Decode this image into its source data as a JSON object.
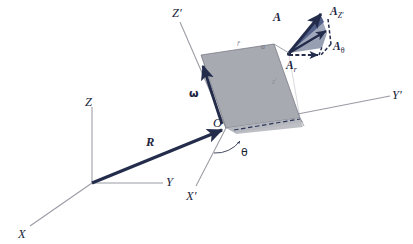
{
  "figure": {
    "type": "vector-diagram",
    "background": "#ffffff"
  },
  "colors": {
    "vector_navy": "#2b3557",
    "vector_navy_dark": "#232c4b",
    "plane_fill": "#a8aab1",
    "plane_fill_light": "#b9bbc2",
    "triangle_fill": "#6b7795",
    "triangle_fill_light": "#9aa2b6",
    "axis_gray": "#9a9ba4",
    "label_ink": "#1a1f33",
    "faint_ink": "#8d8f9c"
  },
  "fixed_frame": {
    "name": "fixed-frame-XYZ",
    "origin_label": "",
    "axes": [
      {
        "id": "axis-Z",
        "label": "Z",
        "description": "vertical axis of fixed frame"
      },
      {
        "id": "axis-Y",
        "label": "Y",
        "description": "horizontal axis of fixed frame"
      },
      {
        "id": "axis-X",
        "label": "X",
        "description": "axis receding to lower left"
      }
    ]
  },
  "rotating_frame": {
    "name": "rotating-frame-XYZ-prime",
    "origin_label": "O",
    "axes": [
      {
        "id": "axis-Z-prime",
        "label": "Z",
        "prime": "′",
        "description": "vertical axis of rotating frame"
      },
      {
        "id": "axis-Y-prime",
        "label": "Y",
        "prime": "′",
        "description": "axis to the right of rotating frame"
      },
      {
        "id": "axis-X-prime",
        "label": "X",
        "prime": "′",
        "description": "axis toward viewer lower left"
      }
    ],
    "angle": {
      "id": "angle-theta",
      "label": "θ",
      "description": "rotation angle between X′ and the rotating plane"
    },
    "angular_velocity": {
      "id": "vector-omega",
      "label": "ω",
      "description": "angular velocity vector along Z′ edge of plane"
    },
    "plane_labels": [
      {
        "id": "label-r-bar",
        "text": "r̄",
        "description": "faint radial label on plane top edge"
      },
      {
        "id": "label-a-point",
        "text": "a",
        "description": "point a at corner of plane"
      },
      {
        "id": "label-z-prime-small",
        "text": "z′",
        "description": "faint z-prime label inside plane"
      }
    ]
  },
  "vectors": [
    {
      "id": "vector-R",
      "label": "R",
      "subscript": "",
      "style": "thick-solid",
      "description": "position vector from fixed origin to rotating origin O"
    },
    {
      "id": "vector-A",
      "label": "A",
      "subscript": "",
      "style": "thick-solid",
      "description": "resultant vector A at point a"
    },
    {
      "id": "vector-A-Zprime",
      "label": "A",
      "subscript": "Z′",
      "style": "thick-solid",
      "description": "component of A along Z-prime"
    },
    {
      "id": "vector-A-theta",
      "label": "A",
      "subscript": "θ",
      "style": "dashed",
      "description": "transverse component of A"
    },
    {
      "id": "vector-A-r",
      "label": "A",
      "subscript": "r",
      "style": "dashed",
      "description": "radial component of A"
    }
  ]
}
